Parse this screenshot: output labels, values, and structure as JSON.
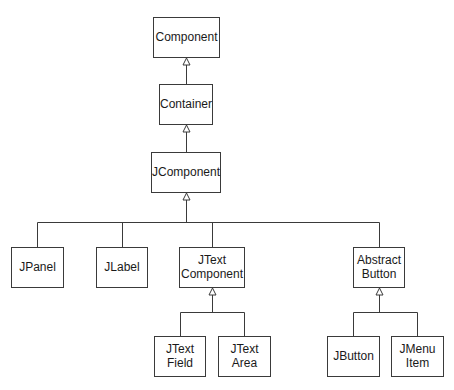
{
  "diagram": {
    "type": "class-hierarchy",
    "colors": {
      "line": "#3a3a3a",
      "box_fill": "#ffffff",
      "text": "#1a1a1a",
      "background": "#ffffff"
    },
    "nodes": [
      {
        "id": "component",
        "lines": [
          "Component"
        ],
        "x": 153,
        "y": 17,
        "w": 66,
        "h": 40
      },
      {
        "id": "container",
        "lines": [
          "Container"
        ],
        "x": 159,
        "y": 84,
        "w": 53,
        "h": 40
      },
      {
        "id": "jcomponent",
        "lines": [
          "JComponent"
        ],
        "x": 151,
        "y": 152,
        "w": 69,
        "h": 40
      },
      {
        "id": "jpanel",
        "lines": [
          "JPanel"
        ],
        "x": 11,
        "y": 247,
        "w": 52,
        "h": 40
      },
      {
        "id": "jlabel",
        "lines": [
          "JLabel"
        ],
        "x": 96,
        "y": 247,
        "w": 51,
        "h": 40
      },
      {
        "id": "jtextcomponent",
        "lines": [
          "JText",
          "Component"
        ],
        "x": 179,
        "y": 247,
        "w": 65,
        "h": 40
      },
      {
        "id": "abstractbutton",
        "lines": [
          "Abstract",
          "Button"
        ],
        "x": 353,
        "y": 247,
        "w": 51,
        "h": 40
      },
      {
        "id": "jtextfield",
        "lines": [
          "JText",
          "Field"
        ],
        "x": 154,
        "y": 336,
        "w": 51,
        "h": 40
      },
      {
        "id": "jtextarea",
        "lines": [
          "JText",
          "Area"
        ],
        "x": 218,
        "y": 336,
        "w": 52,
        "h": 40
      },
      {
        "id": "jbutton",
        "lines": [
          "JButton"
        ],
        "x": 327,
        "y": 336,
        "w": 52,
        "h": 40
      },
      {
        "id": "jmenuitem",
        "lines": [
          "JMenu",
          "Item"
        ],
        "x": 391,
        "y": 336,
        "w": 52,
        "h": 40
      }
    ],
    "edges": [
      {
        "parent": "component",
        "children": [
          "container"
        ],
        "bus_y": null
      },
      {
        "parent": "container",
        "children": [
          "jcomponent"
        ],
        "bus_y": null
      },
      {
        "parent": "jcomponent",
        "children": [
          "jpanel",
          "jlabel",
          "jtextcomponent",
          "abstractbutton"
        ],
        "bus_y": 222
      },
      {
        "parent": "jtextcomponent",
        "children": [
          "jtextfield",
          "jtextarea"
        ],
        "bus_y": 312
      },
      {
        "parent": "abstractbutton",
        "children": [
          "jbutton",
          "jmenuitem"
        ],
        "bus_y": 312
      }
    ],
    "arrow_style": "hollow-triangle-inheritance"
  }
}
